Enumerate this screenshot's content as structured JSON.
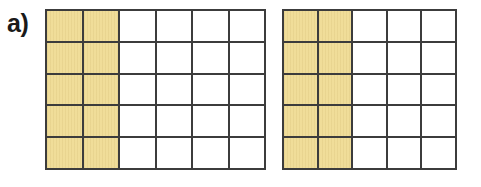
{
  "figure": {
    "part_label": "a)",
    "colors": {
      "shaded_fill": "#f0dd99",
      "grid_line": "#3c3c3c",
      "background": "#ffffff",
      "label_text": "#1a1a1a"
    },
    "grids": [
      {
        "name": "left-grid",
        "columns": 6,
        "rows": 5,
        "total_cells": 30,
        "shaded_columns": 2,
        "shaded_cells": 10,
        "fraction_text": "10/30",
        "cells": [
          [
            "shaded",
            "shaded",
            "empty",
            "empty",
            "empty",
            "empty"
          ],
          [
            "shaded",
            "shaded",
            "empty",
            "empty",
            "empty",
            "empty"
          ],
          [
            "shaded",
            "shaded",
            "empty",
            "empty",
            "empty",
            "empty"
          ],
          [
            "shaded",
            "shaded",
            "empty",
            "empty",
            "empty",
            "empty"
          ],
          [
            "shaded",
            "shaded",
            "empty",
            "empty",
            "empty",
            "empty"
          ]
        ]
      },
      {
        "name": "right-grid",
        "columns": 5,
        "rows": 5,
        "total_cells": 25,
        "shaded_columns": 2,
        "shaded_cells": 10,
        "fraction_text": "10/25",
        "cells": [
          [
            "shaded",
            "shaded",
            "empty",
            "empty",
            "empty"
          ],
          [
            "shaded",
            "shaded",
            "empty",
            "empty",
            "empty"
          ],
          [
            "shaded",
            "shaded",
            "empty",
            "empty",
            "empty"
          ],
          [
            "shaded",
            "shaded",
            "empty",
            "empty",
            "empty"
          ],
          [
            "shaded",
            "shaded",
            "empty",
            "empty",
            "empty"
          ]
        ]
      }
    ]
  }
}
